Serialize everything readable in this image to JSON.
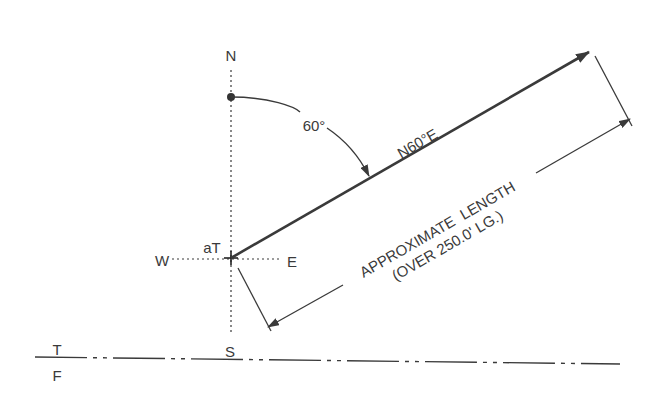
{
  "diagram": {
    "compass": {
      "north": "N",
      "south": "S",
      "east": "E",
      "west": "W"
    },
    "origin_label": "aT",
    "angle_label": "60°",
    "bearing_label": "N60°E",
    "dimension": {
      "line1": "APPROXIMATE  LENGTH",
      "line2": "(OVER 250.0' LG.)"
    },
    "baseline": {
      "top_label": "T",
      "bottom_label": "F"
    },
    "colors": {
      "line": "#3a3a3a",
      "text": "#3a3a3a",
      "background": "#ffffff"
    }
  }
}
